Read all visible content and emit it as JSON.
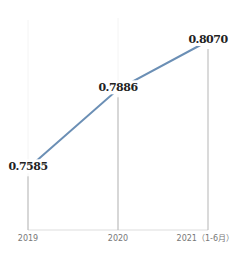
{
  "chart_data": {
    "type": "line",
    "title": "",
    "xlabel": "",
    "ylabel": "",
    "categories": [
      "2019",
      "2020",
      "2021（1-6月）"
    ],
    "series": [
      {
        "name": "",
        "values": [
          0.7585,
          0.7886,
          0.807
        ],
        "labels": [
          "0.7585",
          "0.7886",
          "0.8070"
        ]
      }
    ],
    "ylim": [
      0.735,
      0.815
    ],
    "grid": false,
    "legend": "none",
    "colors": {
      "line": "#6b8fb5",
      "drop_line": "#b5b5b5",
      "axis": "#dddddd",
      "label": "#222222",
      "tick": "#777777"
    }
  }
}
